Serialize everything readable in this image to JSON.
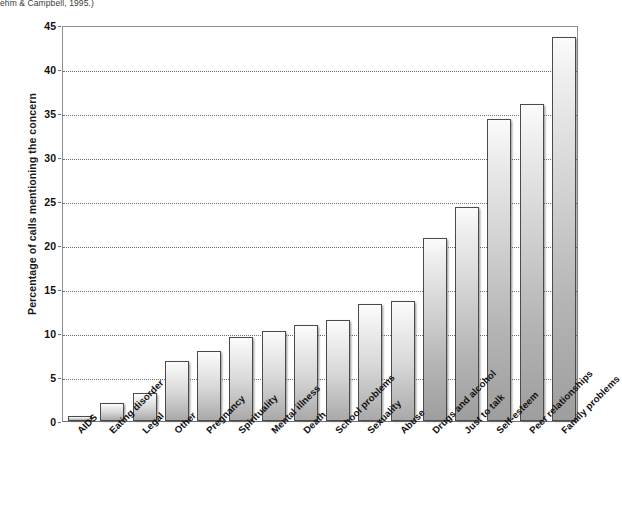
{
  "caption": {
    "text": "ehm & Campbell, 1995.)"
  },
  "chart_data": {
    "type": "bar",
    "title": "",
    "xlabel": "",
    "ylabel": "Percentage of calls mentioning the concern",
    "ylim": [
      0,
      45
    ],
    "ytick_step": 5,
    "yticks": [
      0,
      5,
      10,
      15,
      20,
      25,
      30,
      35,
      40,
      45
    ],
    "grid": true,
    "legend": null,
    "categories": [
      "AIDS",
      "Eating disorder",
      "Legal",
      "Other",
      "Pregnancy",
      "Spirituality",
      "Mental illness",
      "Death",
      "School problems",
      "Sexuality",
      "Abuse",
      "Drugs and alcohol",
      "Just to talk",
      "Self-esteem",
      "Peer relationships",
      "Family problems"
    ],
    "values": [
      0.6,
      2.1,
      3.2,
      6.8,
      7.9,
      9.5,
      10.2,
      10.9,
      11.5,
      13.3,
      13.6,
      20.8,
      24.3,
      34.3,
      36.0,
      43.6
    ]
  },
  "colors": {
    "bar_top": "#fcfcfc",
    "bar_bottom": "#a9a9a9",
    "bar_border": "#4a4a4a",
    "gridline": "#6d6d6d",
    "axis": "#8f8f8f",
    "text": "#111111"
  }
}
